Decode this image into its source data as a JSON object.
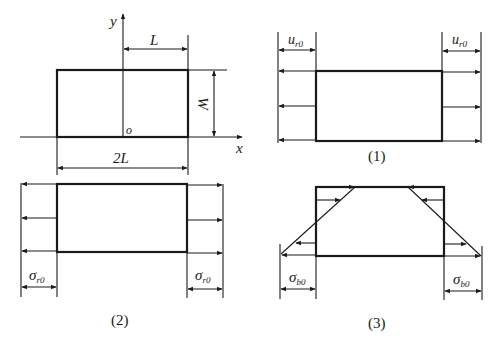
{
  "figure": {
    "panel_0": {
      "description": "rectangular plate geometry with coordinate axes",
      "axis_x_label": "x",
      "axis_y_label": "y",
      "origin_label": "o",
      "half_length_label": "L",
      "full_length_label": "2L",
      "width_label": "W"
    },
    "panel_1": {
      "caption": "(1)",
      "dim_left": {
        "symbol": "u",
        "subscript": "r0"
      },
      "dim_right": {
        "symbol": "u",
        "subscript": "r0"
      },
      "load_type": "uniform displacement"
    },
    "panel_2": {
      "caption": "(2)",
      "dim_left": {
        "symbol": "σ",
        "subscript": "r0"
      },
      "dim_right": {
        "symbol": "σ",
        "subscript": "r0"
      },
      "load_type": "uniform stress"
    },
    "panel_3": {
      "caption": "(3)",
      "dim_left": {
        "symbol": "σ",
        "subscript": "b0"
      },
      "dim_right": {
        "symbol": "σ",
        "subscript": "b0"
      },
      "load_type": "linear bending stress"
    }
  },
  "colors": {
    "stroke": "#1a1a1a",
    "background": "#ffffff"
  }
}
